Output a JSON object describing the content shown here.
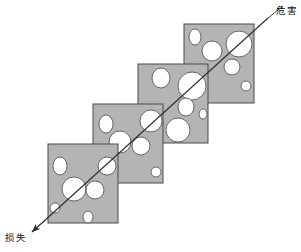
{
  "figure": {
    "width": 301,
    "height": 252,
    "background": "#ffffff",
    "panel_fill": "#b4b4b4",
    "panel_stroke": "#4a4a4a",
    "hole_fill": "#ffffff",
    "hole_stroke": "#585858",
    "line_color": "#2b2b2b"
  },
  "labels": {
    "hazard": "危害",
    "loss": "损失"
  },
  "trajectory": {
    "name": "accident-trajectory-arrow",
    "start_x": 268,
    "start_y": 18,
    "end_x": 32,
    "end_y": 232,
    "arrowhead_at": "loss-end",
    "direction": "top-right to bottom-left"
  },
  "leader": {
    "from_x": 268,
    "from_y": 18,
    "to_x": 283,
    "to_y": 6
  },
  "panels": [
    {
      "id": "panel-1",
      "order": 1,
      "x": 48,
      "y": 144,
      "width": 70,
      "height": 79,
      "holes": [
        {
          "cx": 12,
          "cy": 22,
          "rx": 7,
          "ry": 9
        },
        {
          "cx": 26,
          "cy": 45,
          "rx": 12,
          "ry": 12
        },
        {
          "cx": 47,
          "cy": 46,
          "rx": 9,
          "ry": 9
        },
        {
          "cx": 59,
          "cy": 22,
          "rx": 9,
          "ry": 9
        },
        {
          "cx": 7,
          "cy": 64,
          "rx": 5,
          "ry": 5
        },
        {
          "cx": 40,
          "cy": 73,
          "rx": 5,
          "ry": 6
        }
      ]
    },
    {
      "id": "panel-2",
      "order": 2,
      "x": 93,
      "y": 104,
      "width": 70,
      "height": 79,
      "holes": [
        {
          "cx": 13,
          "cy": 20,
          "rx": 7,
          "ry": 9
        },
        {
          "cx": 27,
          "cy": 38,
          "rx": 11,
          "ry": 11
        },
        {
          "cx": 48,
          "cy": 42,
          "rx": 9,
          "ry": 9
        },
        {
          "cx": 58,
          "cy": 17,
          "rx": 11,
          "ry": 11
        },
        {
          "cx": 63,
          "cy": 68,
          "rx": 5,
          "ry": 5
        }
      ]
    },
    {
      "id": "panel-3",
      "order": 3,
      "x": 138,
      "y": 64,
      "width": 70,
      "height": 79,
      "holes": [
        {
          "cx": 23,
          "cy": 14,
          "rx": 9,
          "ry": 10
        },
        {
          "cx": 54,
          "cy": 22,
          "rx": 14,
          "ry": 14
        },
        {
          "cx": 48,
          "cy": 43,
          "rx": 8,
          "ry": 9
        },
        {
          "cx": 65,
          "cy": 50,
          "rx": 4,
          "ry": 5
        },
        {
          "cx": 40,
          "cy": 66,
          "rx": 12,
          "ry": 12
        }
      ]
    },
    {
      "id": "panel-4",
      "order": 4,
      "x": 184,
      "y": 24,
      "width": 70,
      "height": 79,
      "holes": [
        {
          "cx": 11,
          "cy": 13,
          "rx": 6,
          "ry": 8
        },
        {
          "cx": 28,
          "cy": 27,
          "rx": 10,
          "ry": 10
        },
        {
          "cx": 55,
          "cy": 20,
          "rx": 13,
          "ry": 13
        },
        {
          "cx": 48,
          "cy": 43,
          "rx": 8,
          "ry": 8
        },
        {
          "cx": 62,
          "cy": 62,
          "rx": 5,
          "ry": 5
        }
      ]
    }
  ]
}
